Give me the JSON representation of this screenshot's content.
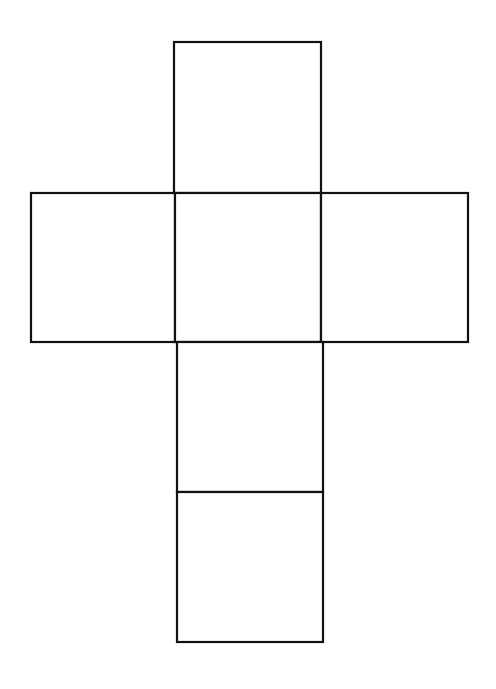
{
  "diagram": {
    "type": "cube-net",
    "stroke_color": "#111111",
    "background_color": "#ffffff",
    "faces": [
      {
        "id": "top",
        "x": 174,
        "y": 42,
        "w": 147,
        "h": 151
      },
      {
        "id": "left",
        "x": 31,
        "y": 193,
        "w": 144,
        "h": 149
      },
      {
        "id": "center",
        "x": 175,
        "y": 193,
        "w": 146,
        "h": 149
      },
      {
        "id": "right",
        "x": 321,
        "y": 193,
        "w": 147,
        "h": 149
      },
      {
        "id": "lower",
        "x": 177,
        "y": 342,
        "w": 146,
        "h": 150
      },
      {
        "id": "bottom",
        "x": 177,
        "y": 492,
        "w": 146,
        "h": 150
      }
    ]
  }
}
